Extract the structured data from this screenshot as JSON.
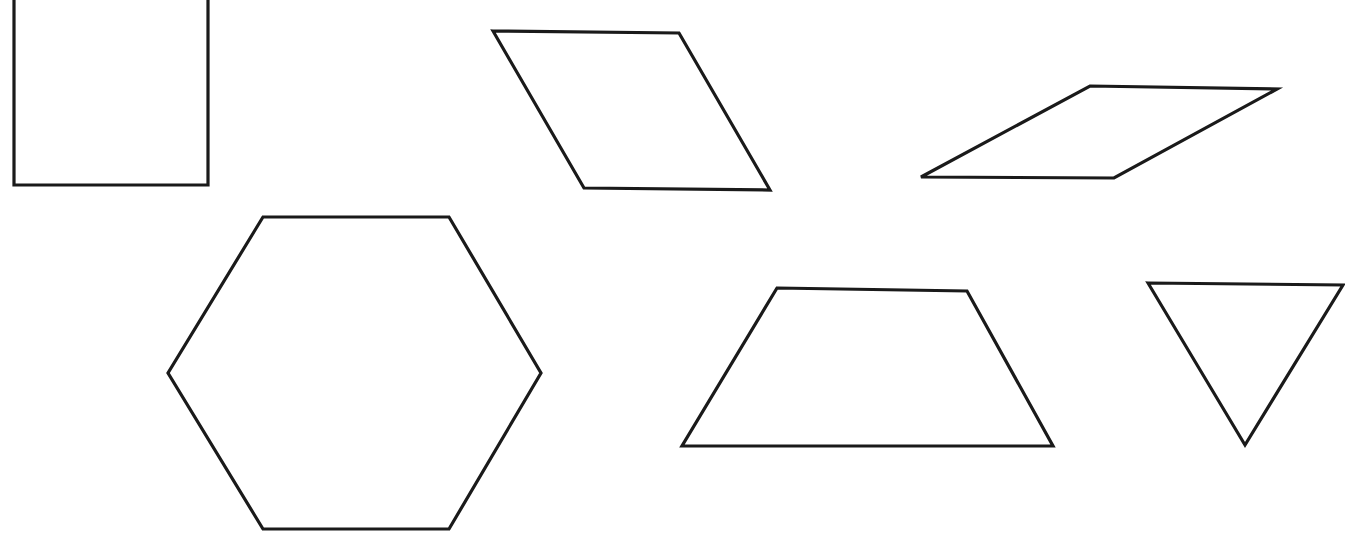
{
  "canvas": {
    "width": 1345,
    "height": 552,
    "background_color": "#ffffff",
    "description": "Worksheet-style line drawing of seven outlined geometric polygons on a plain white background"
  },
  "style": {
    "stroke_color": "#1a1a1a",
    "stroke_width": 3.2,
    "fill": "none"
  },
  "shapes": [
    {
      "id": "square",
      "name": "square",
      "label": "Square",
      "sides": 4,
      "clipped_at_top_edge": true,
      "points": "14,-20 208,-20 208,185 14,185",
      "bbox": {
        "x": 14,
        "y": 0,
        "width": 194,
        "height": 185
      }
    },
    {
      "id": "parallelogram-upper-left",
      "name": "parallelogram",
      "label": "Parallelogram",
      "sides": 4,
      "clipped_at_top_edge": false,
      "points": "493,31 679,33 770,190 584,188",
      "bbox": {
        "x": 493,
        "y": 31,
        "width": 277,
        "height": 159
      }
    },
    {
      "id": "parallelogram-upper-right",
      "name": "parallelogram",
      "label": "Parallelogram",
      "sides": 4,
      "clipped_at_top_edge": false,
      "points": "1090,86 1277,89 1114,178 921,177",
      "bbox": {
        "x": 921,
        "y": 86,
        "width": 356,
        "height": 92
      }
    },
    {
      "id": "hexagon",
      "name": "hexagon",
      "label": "Hexagon",
      "sides": 6,
      "clipped_at_top_edge": false,
      "points": "263,217 449,217 541,373 449,529 263,529 168,373",
      "bbox": {
        "x": 168,
        "y": 217,
        "width": 373,
        "height": 312
      }
    },
    {
      "id": "trapezoid",
      "name": "trapezoid",
      "label": "Trapezoid",
      "sides": 4,
      "clipped_at_top_edge": false,
      "points": "777,288 967,291 1053,446 682,446",
      "bbox": {
        "x": 682,
        "y": 288,
        "width": 371,
        "height": 158
      }
    },
    {
      "id": "triangle",
      "name": "triangle",
      "label": "Triangle",
      "sides": 3,
      "clipped_at_top_edge": false,
      "points": "1148,283 1343,285 1245,445",
      "bbox": {
        "x": 1148,
        "y": 283,
        "width": 195,
        "height": 162
      }
    }
  ]
}
